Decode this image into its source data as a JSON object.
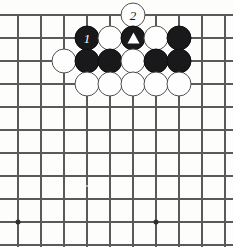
{
  "diagram": {
    "type": "go-board-diagram",
    "title": "",
    "board": {
      "width_px": 233,
      "height_px": 247,
      "grid_spacing_px": 23,
      "stone_diameter_px": 25,
      "origin_x_px": 18,
      "origin_y_px": 15,
      "columns_px": [
        18,
        41,
        64,
        87,
        110,
        133,
        156,
        179,
        202,
        225
      ],
      "rows_px": [
        15,
        38,
        61,
        84,
        107,
        130,
        153,
        176,
        199,
        222,
        245
      ],
      "top_edge_is_board_edge": true,
      "line_color": "#595a5c",
      "background_color": "#fdfdfc"
    },
    "colors": {
      "black_stone": "#19191b",
      "white_stone": "#fefefe",
      "white_stone_outline": "#4e4f51",
      "star_point": "#2f3032",
      "black_label_text": "#ffffff",
      "white_label_text": "#18181a"
    },
    "star_points": [
      {
        "name": "star-point-left",
        "x": 18,
        "y": 222
      },
      {
        "name": "star-point-right",
        "x": 156,
        "y": 222
      }
    ],
    "stones": [
      {
        "name": "stone-white-move-2",
        "color": "white",
        "x": 133,
        "y": 15,
        "label": "2",
        "mark": ""
      },
      {
        "name": "stone-black-move-1",
        "color": "black",
        "x": 87,
        "y": 38,
        "label": "1",
        "mark": ""
      },
      {
        "name": "stone-white-r1-c110",
        "color": "white",
        "x": 110,
        "y": 38,
        "label": "",
        "mark": ""
      },
      {
        "name": "stone-black-triangle",
        "color": "black",
        "x": 133,
        "y": 38,
        "label": "",
        "mark": "triangle"
      },
      {
        "name": "stone-white-r1-c156",
        "color": "white",
        "x": 156,
        "y": 38,
        "label": "",
        "mark": ""
      },
      {
        "name": "stone-black-r1-c179",
        "color": "black",
        "x": 179,
        "y": 38,
        "label": "",
        "mark": ""
      },
      {
        "name": "stone-white-r2-c64",
        "color": "white",
        "x": 64,
        "y": 61,
        "label": "",
        "mark": ""
      },
      {
        "name": "stone-black-r2-c87",
        "color": "black",
        "x": 87,
        "y": 61,
        "label": "",
        "mark": ""
      },
      {
        "name": "stone-black-r2-c110",
        "color": "black",
        "x": 110,
        "y": 61,
        "label": "",
        "mark": ""
      },
      {
        "name": "stone-white-r2-c133",
        "color": "white",
        "x": 133,
        "y": 61,
        "label": "",
        "mark": ""
      },
      {
        "name": "stone-black-r2-c156",
        "color": "black",
        "x": 156,
        "y": 61,
        "label": "",
        "mark": ""
      },
      {
        "name": "stone-black-r2-c179",
        "color": "black",
        "x": 179,
        "y": 61,
        "label": "",
        "mark": ""
      },
      {
        "name": "stone-white-r3-c87",
        "color": "white",
        "x": 87,
        "y": 84,
        "label": "",
        "mark": ""
      },
      {
        "name": "stone-white-r3-c110",
        "color": "white",
        "x": 110,
        "y": 84,
        "label": "",
        "mark": ""
      },
      {
        "name": "stone-white-r3-c133",
        "color": "white",
        "x": 133,
        "y": 84,
        "label": "",
        "mark": ""
      },
      {
        "name": "stone-white-r3-c156",
        "color": "white",
        "x": 156,
        "y": 84,
        "label": "",
        "mark": ""
      },
      {
        "name": "stone-white-r3-c179",
        "color": "white",
        "x": 179,
        "y": 84,
        "label": "",
        "mark": ""
      }
    ],
    "specks": [
      {
        "x": 87,
        "y": 186
      }
    ]
  }
}
